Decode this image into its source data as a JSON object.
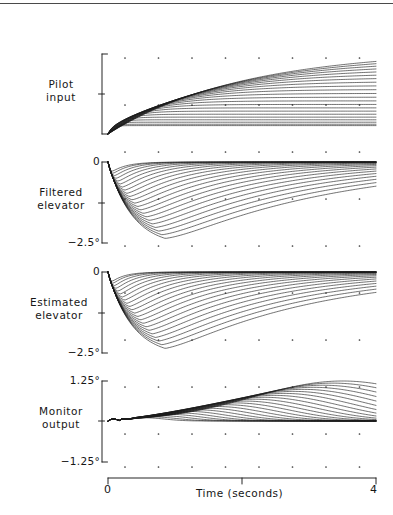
{
  "figure": {
    "background": "#ffffff",
    "ink_color": "#1a1a1a",
    "plot_left_px": 108,
    "plot_right_px": 376,
    "curve_count": 22
  },
  "panels": [
    {
      "id": "pilot-input",
      "label": "Pilot\ninput",
      "label_line1": "Pilot",
      "label_line2": "input",
      "axis_top_label": "",
      "axis_mid_label": "",
      "axis_bottom_label": "",
      "bracket_top_px": 54,
      "bracket_bottom_px": 134,
      "bracket_tick_px": 94,
      "baseline_px": 134,
      "kind": "ramp-family"
    },
    {
      "id": "filtered-elevator",
      "label": "Filtered\nelevator",
      "label_line1": "Filtered",
      "label_line2": "elevator",
      "axis_top_label": "0",
      "axis_mid_label": "",
      "axis_bottom_label": "−2.5°",
      "bracket_top_px": 162,
      "bracket_bottom_px": 243,
      "bracket_tick_px": 203,
      "baseline_px": 162,
      "kind": "dip-family"
    },
    {
      "id": "estimated-elevator",
      "label": "Estimated\nelevator",
      "label_line1": "Estimated",
      "label_line2": "elevator",
      "axis_top_label": "0",
      "axis_mid_label": "",
      "axis_bottom_label": "−2.5°",
      "bracket_top_px": 272,
      "bracket_bottom_px": 353,
      "bracket_tick_px": 313,
      "baseline_px": 272,
      "kind": "dip-family"
    },
    {
      "id": "monitor-output",
      "label": "Monitor\noutput",
      "label_line1": "Monitor",
      "label_line2": "output",
      "axis_top_label": "1.25°",
      "axis_mid_label": "",
      "axis_bottom_label": "−1.25°",
      "bracket_top_px": 381,
      "bracket_bottom_px": 462,
      "bracket_tick_px": 421,
      "baseline_px": 421,
      "kind": "hump-family"
    }
  ],
  "xaxis": {
    "label": "Time (seconds)",
    "min_label": "0",
    "max_label": "4",
    "min": 0,
    "max": 4,
    "ticks": [
      0,
      2,
      4
    ],
    "axis_y_px": 478,
    "bar_left_px": 108,
    "bar_right_px": 376
  },
  "grid": {
    "style": "dot-matrix",
    "dot_color": "#3a3a3a",
    "dot_radius_px": 0.85,
    "col_spacing_px": 33.5,
    "first_col_px": 125,
    "rows_px": [
      58,
      105,
      152,
      199,
      246,
      293,
      340,
      387,
      434,
      467
    ]
  },
  "chart_data": {
    "type": "line",
    "xlabel": "Time (seconds)",
    "ylabel": "",
    "xlim": [
      0,
      4
    ],
    "grid": "dotted",
    "legend": "none",
    "panels": [
      {
        "name": "Pilot input",
        "ylim_labels": [
          "",
          ""
        ],
        "ylabel_lines": [
          "Pilot",
          "input"
        ],
        "series_count": 22,
        "shape": "monotonic rising ramp to sustained plateau",
        "notes": "Each trace rises from zero at its own onset and holds a constant level; later-onset traces reach progressively higher plateaus."
      },
      {
        "name": "Filtered elevator",
        "ylim": [
          -2.5,
          0
        ],
        "ytick_labels": [
          "0",
          "−2.5°"
        ],
        "ylabel_lines": [
          "Filtered",
          "elevator"
        ],
        "series_count": 22,
        "shape": "sharp negative dip then exponential recovery toward zero",
        "notes": "Minimum excursions reach about −2.5 degrees; recovery time lengthens with later onset."
      },
      {
        "name": "Estimated elevator",
        "ylim": [
          -2.5,
          0
        ],
        "ytick_labels": [
          "0",
          "−2.5°"
        ],
        "ylabel_lines": [
          "Estimated",
          "elevator"
        ],
        "series_count": 22,
        "shape": "sharp negative dip then exponential recovery toward zero",
        "notes": "Closely tracks the filtered elevator panel; dips to about −2.5 degrees."
      },
      {
        "name": "Monitor output",
        "ylim": [
          -1.25,
          1.25
        ],
        "ytick_labels": [
          "1.25°",
          "−1.25°"
        ],
        "ylabel_lines": [
          "Monitor",
          "output"
        ],
        "series_count": 22,
        "shape": "small transient near t=0 then broad positive hump returning toward zero",
        "notes": "Peak residuals stay within about +1.25 degrees; no trace exceeds the ±1.25 degree monitor threshold."
      }
    ]
  }
}
